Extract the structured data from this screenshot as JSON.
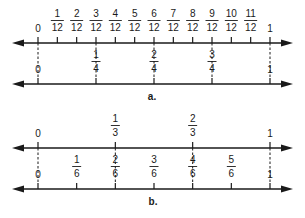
{
  "diagram": {
    "colors": {
      "ink": "#1a1a1a",
      "background": "#ffffff"
    },
    "geometry": {
      "x0": 38,
      "x1": 270,
      "arrow_left": 12,
      "arrow_right": 293
    },
    "parts": [
      {
        "id": "a",
        "caption": "a.",
        "caption_pos": [
          152,
          100
        ],
        "lines": [
          {
            "y": 43,
            "denominator": 12,
            "labels": [
              {
                "value": 0,
                "text": "0"
              },
              {
                "num": "1",
                "den": "12",
                "value": 0.08333
              },
              {
                "num": "2",
                "den": "12",
                "value": 0.16667
              },
              {
                "num": "3",
                "den": "12",
                "value": 0.25
              },
              {
                "num": "4",
                "den": "12",
                "value": 0.33333
              },
              {
                "num": "5",
                "den": "12",
                "value": 0.41667
              },
              {
                "num": "6",
                "den": "12",
                "value": 0.5
              },
              {
                "num": "7",
                "den": "12",
                "value": 0.58333
              },
              {
                "num": "8",
                "den": "12",
                "value": 0.66667
              },
              {
                "num": "9",
                "den": "12",
                "value": 0.75
              },
              {
                "num": "10",
                "den": "12",
                "value": 0.83333
              },
              {
                "num": "11",
                "den": "12",
                "value": 0.91667
              },
              {
                "value": 1,
                "text": "1"
              }
            ]
          },
          {
            "y": 84,
            "denominator": 4,
            "labels": [
              {
                "value": 0,
                "text": "0"
              },
              {
                "num": "1",
                "den": "4",
                "value": 0.25
              },
              {
                "num": "2",
                "den": "4",
                "value": 0.5
              },
              {
                "num": "3",
                "den": "4",
                "value": 0.75
              },
              {
                "value": 1,
                "text": "1"
              }
            ]
          }
        ],
        "connectors": [
          0,
          0.25,
          0.5,
          0.75,
          1
        ]
      },
      {
        "id": "b",
        "caption": "b.",
        "caption_pos": [
          153,
          205
        ],
        "lines": [
          {
            "y": 148,
            "denominator": 3,
            "labels": [
              {
                "value": 0,
                "text": "0"
              },
              {
                "num": "1",
                "den": "3",
                "value": 0.33333
              },
              {
                "num": "2",
                "den": "3",
                "value": 0.66667
              },
              {
                "value": 1,
                "text": "1"
              }
            ]
          },
          {
            "y": 189,
            "denominator": 6,
            "labels": [
              {
                "value": 0,
                "text": "0"
              },
              {
                "num": "1",
                "den": "6",
                "value": 0.16667
              },
              {
                "num": "2",
                "den": "6",
                "value": 0.33333
              },
              {
                "num": "3",
                "den": "6",
                "value": 0.5
              },
              {
                "num": "4",
                "den": "6",
                "value": 0.66667
              },
              {
                "num": "5",
                "den": "6",
                "value": 0.83333
              },
              {
                "value": 1,
                "text": "1"
              }
            ]
          }
        ],
        "connectors": [
          0,
          0.33333,
          0.66667,
          1
        ]
      }
    ]
  }
}
